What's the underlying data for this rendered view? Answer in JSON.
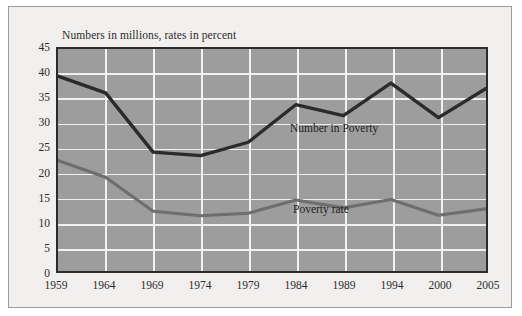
{
  "chart_data": {
    "type": "line",
    "title": "Numbers in millions, rates in percent",
    "xlabel": "",
    "ylabel": "",
    "ylim": [
      0,
      45
    ],
    "ytick_step": 5,
    "grid": true,
    "legend_position": "inline-annotation",
    "categories": [
      "1959",
      "1964",
      "1969",
      "1974",
      "1979",
      "1984",
      "1989",
      "1994",
      "2000",
      "2005"
    ],
    "yticks": [
      "45",
      "40",
      "35",
      "30",
      "25",
      "20",
      "15",
      "10",
      "5",
      "0"
    ],
    "series": [
      {
        "name": "Number in Poverty",
        "color": "#2b2b2b",
        "values": [
          39.5,
          36.1,
          24.1,
          23.4,
          26.1,
          33.7,
          31.5,
          38.1,
          31.1,
          37.0
        ]
      },
      {
        "name": "Poverty rate",
        "color": "#6e6e6e",
        "values": [
          22.4,
          19.0,
          12.1,
          11.2,
          11.7,
          14.4,
          12.8,
          14.5,
          11.3,
          12.6
        ]
      }
    ],
    "annotations": [
      {
        "text": "Number in Poverty",
        "series": "Number in Poverty"
      },
      {
        "text": "Poverty rate",
        "series": "Poverty rate"
      }
    ]
  },
  "colors": {
    "page_background": "#ffffff",
    "panel_background": "#f2f0ee",
    "plot_background": "#9d9d9d",
    "gridline": "#f0f0f0",
    "axis_border": "#2b2b2b",
    "text": "#2c2c2c",
    "series_number_in_poverty": "#2b2b2b",
    "series_poverty_rate": "#6e6e6e"
  }
}
